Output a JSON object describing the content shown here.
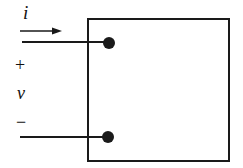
{
  "diagram": {
    "type": "two-terminal element",
    "labels": {
      "current": "i",
      "plus": "+",
      "voltage": "v",
      "minus": "−"
    },
    "colors": {
      "stroke": "#1a1a1a",
      "background": "#ffffff"
    }
  }
}
